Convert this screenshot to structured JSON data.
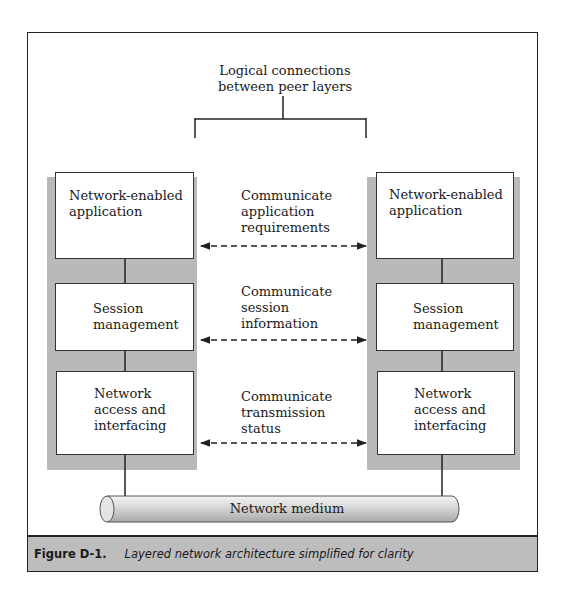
{
  "figure": {
    "top_label": [
      "Logical connections",
      "between peer layers"
    ],
    "left_stack": {
      "layers": [
        {
          "name": "application",
          "label": [
            "Network-enabled",
            "application"
          ]
        },
        {
          "name": "session",
          "label": [
            "Session",
            "management"
          ]
        },
        {
          "name": "network-access",
          "label": [
            "Network",
            "access and",
            "interfacing"
          ]
        }
      ]
    },
    "right_stack": {
      "layers": [
        {
          "name": "application",
          "label": [
            "Network-enabled",
            "application"
          ]
        },
        {
          "name": "session",
          "label": [
            "Session",
            "management"
          ]
        },
        {
          "name": "network-access",
          "label": [
            "Network",
            "access and",
            "interfacing"
          ]
        }
      ]
    },
    "peer_links": [
      {
        "label": [
          "Communicate",
          "application",
          "requirements"
        ]
      },
      {
        "label": [
          "Communicate",
          "session",
          "information"
        ]
      },
      {
        "label": [
          "Communicate",
          "transmission",
          "status"
        ]
      }
    ],
    "medium_label": "Network medium",
    "colors": {
      "column_fill": "#b9b9b9",
      "caption_fill": "#bdbdbd",
      "line": "#222222"
    }
  },
  "caption": {
    "number": "Figure D-1.",
    "text": "Layered network architecture simplified for clarity"
  }
}
